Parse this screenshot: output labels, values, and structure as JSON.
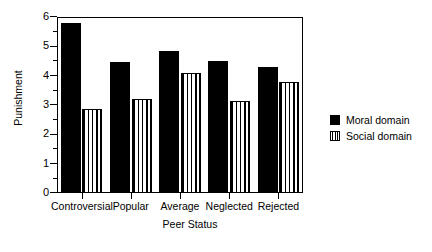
{
  "chart_data": {
    "type": "bar",
    "title": "",
    "xlabel": "Peer Status",
    "ylabel": "Punishment",
    "categories": [
      "Controversial",
      "Popular",
      "Average",
      "Neglected",
      "Rejected"
    ],
    "series": [
      {
        "name": "Moral domain",
        "values": [
          5.8,
          4.45,
          4.85,
          4.5,
          4.3
        ]
      },
      {
        "name": "Social domain",
        "values": [
          2.85,
          3.2,
          4.1,
          3.15,
          3.8
        ]
      }
    ],
    "ylim": [
      0,
      6
    ],
    "yticks": [
      0,
      1,
      2,
      3,
      4,
      5,
      6
    ],
    "ytick_labels": [
      "0",
      "1",
      "2",
      "3",
      "4",
      "5",
      "6"
    ],
    "yminor_ticks": [
      0.5,
      1.5,
      2.5,
      3.5,
      4.5,
      5.5
    ],
    "grid": false,
    "legend_position": "right",
    "legend": [
      "Moral domain",
      "Social domain"
    ],
    "colors": {
      "moral": "#000000",
      "social": "#ffffff",
      "axis": "#000000",
      "background": "#ffffff"
    }
  }
}
